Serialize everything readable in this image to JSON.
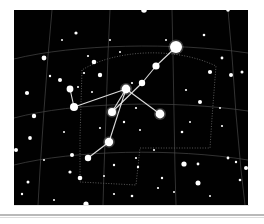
{
  "page": {
    "background_color": "#ffffff",
    "rule_color": "#b9b9b9",
    "caption": ""
  },
  "figure": {
    "plate_background": "#010101",
    "plate_rect": {
      "x": 14,
      "y": 10,
      "width": 234,
      "height": 195
    },
    "star_color": "#ffffff",
    "grid_color": "#4a4a4a",
    "boundary_color": "#5a5a5a",
    "constellation_line_color": "#e8e8e8"
  },
  "chart_data": {
    "type": "scatter",
    "subtitle": "",
    "xlabel": "",
    "ylabel": "",
    "xlim": [
      0,
      234
    ],
    "ylim": [
      0,
      195
    ],
    "grid": true,
    "legend_position": "none",
    "annotations": [],
    "coordinate_grid": {
      "description": "celestial RA/Dec grid, curved meridians and parallels",
      "meridians": [
        "M 38 0 L 34 46 L 30 100 L 26 160 L 24 195",
        "M 96 0 L 94 44 L 92 104 L 90 160 L 89 195",
        "M 158 0 L 159 46 L 160 104 L 161 160 L 162 195",
        "M 214 0 L 218 46 L 222 104 L 227 160 L 231 195"
      ],
      "parallels": [
        "M 0 49 C 60 34, 160 32, 234 43",
        "M 0 108 C 60 92, 160 90, 234 101",
        "M 0 155 C 60 140, 160 138, 234 150"
      ]
    },
    "constellation_boundary": {
      "description": "dotted constellation border polygon",
      "path": "M 68 60 L 66 128 L 66 172 L 122 175 L 126 138 L 196 138 L 198 108 L 202 56 C 160 36, 100 40, 68 60 Z"
    },
    "constellation_lines": [
      {
        "from": "deneb",
        "to": "sadr_upper_1"
      },
      {
        "from": "sadr_upper_1",
        "to": "sadr_upper_2"
      },
      {
        "from": "sadr_upper_2",
        "to": "sadr_upper_3"
      },
      {
        "from": "sadr_upper_3",
        "to": "sadr"
      },
      {
        "from": "sadr",
        "to": "gienah_west_1"
      },
      {
        "from": "gienah_west_1",
        "to": "gienah_west_2"
      },
      {
        "from": "sadr",
        "to": "delta_cyg_east"
      },
      {
        "from": "sadr",
        "to": "eta_cyg"
      },
      {
        "from": "eta_cyg",
        "to": "albireo"
      }
    ],
    "stars": [
      {
        "name": "deneb",
        "x": 162,
        "y": 37,
        "mag_radius": 6.0,
        "glow": true
      },
      {
        "name": "sadr_upper_1",
        "x": 142,
        "y": 56,
        "mag_radius": 3.6,
        "glow": false
      },
      {
        "name": "sadr_upper_2",
        "x": 128,
        "y": 73,
        "mag_radius": 3.2,
        "glow": false
      },
      {
        "name": "sadr",
        "x": 112,
        "y": 79,
        "mag_radius": 4.4,
        "glow": true
      },
      {
        "name": "sadr_upper_3",
        "x": 98,
        "y": 102,
        "mag_radius": 4.0,
        "glow": true
      },
      {
        "name": "gienah_west_1",
        "x": 60,
        "y": 97,
        "mag_radius": 4.0,
        "glow": false
      },
      {
        "name": "gienah_west_2",
        "x": 56,
        "y": 79,
        "mag_radius": 3.4,
        "glow": false
      },
      {
        "name": "delta_cyg_east",
        "x": 146,
        "y": 104,
        "mag_radius": 4.4,
        "glow": true
      },
      {
        "name": "eta_cyg",
        "x": 95,
        "y": 132,
        "mag_radius": 4.2,
        "glow": true
      },
      {
        "name": "albireo",
        "x": 74,
        "y": 148,
        "mag_radius": 3.2,
        "glow": false
      }
    ],
    "field_stars": [
      {
        "x": 130,
        "y": 0,
        "r": 2.8
      },
      {
        "x": 214,
        "y": 0,
        "r": 1.8
      },
      {
        "x": 62,
        "y": 23,
        "r": 1.6
      },
      {
        "x": 190,
        "y": 25,
        "r": 1.3
      },
      {
        "x": 30,
        "y": 48,
        "r": 2.4
      },
      {
        "x": 74,
        "y": 46,
        "r": 1.1
      },
      {
        "x": 80,
        "y": 52,
        "r": 2.3
      },
      {
        "x": 208,
        "y": 48,
        "r": 1.4
      },
      {
        "x": 36,
        "y": 66,
        "r": 1.2
      },
      {
        "x": 46,
        "y": 70,
        "r": 2.0
      },
      {
        "x": 70,
        "y": 63,
        "r": 1.1
      },
      {
        "x": 86,
        "y": 65,
        "r": 2.2
      },
      {
        "x": 196,
        "y": 62,
        "r": 2.1
      },
      {
        "x": 217,
        "y": 65,
        "r": 2.0
      },
      {
        "x": 228,
        "y": 62,
        "r": 1.5
      },
      {
        "x": 13,
        "y": 83,
        "r": 2.1
      },
      {
        "x": 64,
        "y": 77,
        "r": 1.0
      },
      {
        "x": 78,
        "y": 82,
        "r": 1.0
      },
      {
        "x": 118,
        "y": 73,
        "r": 1.1
      },
      {
        "x": 172,
        "y": 80,
        "r": 1.1
      },
      {
        "x": 186,
        "y": 92,
        "r": 2.0
      },
      {
        "x": 20,
        "y": 106,
        "r": 2.2
      },
      {
        "x": 122,
        "y": 98,
        "r": 1.1
      },
      {
        "x": 110,
        "y": 112,
        "r": 1.2
      },
      {
        "x": 168,
        "y": 122,
        "r": 1.3
      },
      {
        "x": 16,
        "y": 128,
        "r": 1.9
      },
      {
        "x": 50,
        "y": 122,
        "r": 1.0
      },
      {
        "x": 86,
        "y": 118,
        "r": 1.1
      },
      {
        "x": 126,
        "y": 120,
        "r": 1.0
      },
      {
        "x": 208,
        "y": 116,
        "r": 1.1
      },
      {
        "x": 2,
        "y": 140,
        "r": 2.0
      },
      {
        "x": 58,
        "y": 145,
        "r": 2.0
      },
      {
        "x": 122,
        "y": 148,
        "r": 1.1
      },
      {
        "x": 140,
        "y": 140,
        "r": 1.0
      },
      {
        "x": 56,
        "y": 162,
        "r": 1.6
      },
      {
        "x": 100,
        "y": 155,
        "r": 1.2
      },
      {
        "x": 124,
        "y": 157,
        "r": 1.2
      },
      {
        "x": 170,
        "y": 154,
        "r": 2.6
      },
      {
        "x": 184,
        "y": 154,
        "r": 1.4
      },
      {
        "x": 214,
        "y": 148,
        "r": 1.4
      },
      {
        "x": 222,
        "y": 152,
        "r": 1.2
      },
      {
        "x": 232,
        "y": 158,
        "r": 2.0
      },
      {
        "x": 14,
        "y": 172,
        "r": 1.5
      },
      {
        "x": 66,
        "y": 168,
        "r": 2.3
      },
      {
        "x": 90,
        "y": 166,
        "r": 1.0
      },
      {
        "x": 148,
        "y": 168,
        "r": 1.2
      },
      {
        "x": 184,
        "y": 173,
        "r": 2.5
      },
      {
        "x": 226,
        "y": 170,
        "r": 1.3
      },
      {
        "x": 8,
        "y": 184,
        "r": 1.2
      },
      {
        "x": 100,
        "y": 184,
        "r": 1.1
      },
      {
        "x": 118,
        "y": 186,
        "r": 1.3
      },
      {
        "x": 144,
        "y": 178,
        "r": 1.1
      },
      {
        "x": 160,
        "y": 182,
        "r": 1.0
      },
      {
        "x": 196,
        "y": 186,
        "r": 1.0
      },
      {
        "x": 72,
        "y": 194,
        "r": 2.6
      },
      {
        "x": 48,
        "y": 30,
        "r": 1.0
      },
      {
        "x": 106,
        "y": 42,
        "r": 1.0
      },
      {
        "x": 152,
        "y": 30,
        "r": 1.0
      },
      {
        "x": 176,
        "y": 112,
        "r": 1.0
      },
      {
        "x": 40,
        "y": 190,
        "r": 1.0
      },
      {
        "x": 206,
        "y": 98,
        "r": 1.0
      },
      {
        "x": 30,
        "y": 150,
        "r": 1.0
      },
      {
        "x": 96,
        "y": 30,
        "r": 1.0
      }
    ]
  }
}
